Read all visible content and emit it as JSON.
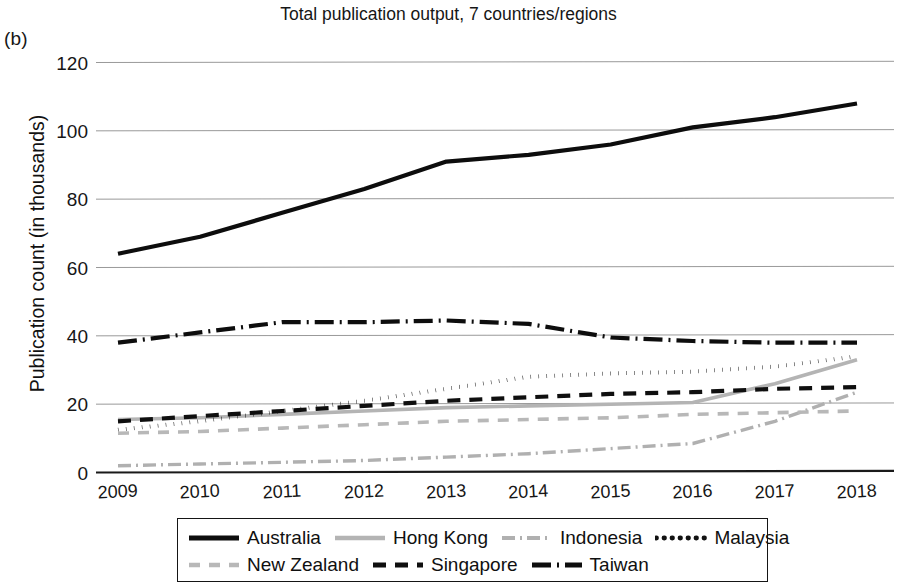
{
  "panel_label": "(b)",
  "chart_data": {
    "type": "line",
    "title": "Total publication output, 7 countries/regions",
    "xlabel": "",
    "ylabel": "Publication count (in thousands)",
    "x": [
      2009,
      2010,
      2011,
      2012,
      2013,
      2014,
      2015,
      2016,
      2017,
      2018
    ],
    "xtick_labels": [
      "2009",
      "2010",
      "2011",
      "2012",
      "2013",
      "2014",
      "2015",
      "2016",
      "2017",
      "2018"
    ],
    "ytick_labels": [
      "0",
      "20",
      "40",
      "60",
      "80",
      "100",
      "120"
    ],
    "yticks": [
      0,
      20,
      40,
      60,
      80,
      100,
      120
    ],
    "ylim": [
      0,
      120
    ],
    "grid": true,
    "legend_position": "bottom",
    "series": [
      {
        "name": "Australia",
        "values": [
          64,
          69,
          76,
          83,
          91,
          93,
          96,
          101,
          104,
          108
        ],
        "color": "#0d0d0d",
        "width": 4.2,
        "dash": "none",
        "dasharray": ""
      },
      {
        "name": "Hong Kong",
        "values": [
          15.5,
          16,
          17,
          18,
          19,
          19.5,
          20,
          20.5,
          26,
          33
        ],
        "color": "#b4b4b4",
        "width": 3.6,
        "dash": "solid",
        "dasharray": ""
      },
      {
        "name": "Indonesia",
        "values": [
          2,
          2.5,
          3,
          3.5,
          4.5,
          5.5,
          7,
          8.5,
          15,
          23.5
        ],
        "color": "#b0b0b0",
        "width": 3.4,
        "dash": "dashdot",
        "dasharray": "13 5 2 5"
      },
      {
        "name": "Malaysia",
        "values": [
          12.5,
          15,
          18,
          21,
          24.5,
          28,
          29,
          29.5,
          31,
          34
        ],
        "color": "#121212",
        "width": 4.0,
        "dash": "dotted",
        "dasharray": "0.5 7.5"
      },
      {
        "name": "New Zealand",
        "values": [
          11.5,
          12,
          13,
          14,
          15,
          15.5,
          16,
          17,
          17.5,
          18
        ],
        "color": "#b8b8b8",
        "width": 3.6,
        "dash": "dashed",
        "dasharray": "11 9"
      },
      {
        "name": "Singapore",
        "values": [
          15,
          16.5,
          18,
          19.5,
          21,
          22,
          23,
          23.5,
          24.5,
          25
        ],
        "color": "#0f0f0f",
        "width": 4.2,
        "dash": "dashed",
        "dasharray": "13 9"
      },
      {
        "name": "Taiwan",
        "values": [
          38,
          41,
          44,
          44,
          44.5,
          43.5,
          39.5,
          38.5,
          38,
          38
        ],
        "color": "#0d0d0d",
        "width": 4.2,
        "dash": "dashdot",
        "dasharray": "19 6 2 6"
      }
    ]
  },
  "legend": {
    "rows": [
      [
        "Australia",
        "Hong Kong",
        "Indonesia",
        "Malaysia"
      ],
      [
        "New Zealand",
        "Singapore",
        "Taiwan"
      ]
    ]
  }
}
